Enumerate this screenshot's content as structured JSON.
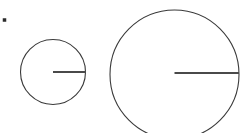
{
  "figure": {
    "background_color": "#ffffff",
    "width": 247,
    "height": 133,
    "stroke_color": "#3a3a3a",
    "radius_stroke_color": "#4a4a4a",
    "bullet_color": "#2b2b2b"
  },
  "chart_data": {
    "type": "diagram",
    "xlabel": "",
    "ylabel": "",
    "grid": false,
    "legend": null,
    "shapes": [
      {
        "name": "bullet-dot",
        "kind": "dot",
        "cx": 4.5,
        "cy": 20,
        "size": 3.5,
        "color": "#2b2b2b"
      },
      {
        "name": "small-circle",
        "kind": "circle",
        "cx": 53,
        "cy": 72,
        "r": 32.5,
        "stroke": "#3a3a3a",
        "stroke_width": 1.1,
        "fill": "none"
      },
      {
        "name": "small-circle-radius",
        "kind": "line",
        "x1": 53,
        "y1": 72,
        "x2": 86,
        "y2": 72,
        "stroke": "#4a4a4a",
        "stroke_width": 2.2
      },
      {
        "name": "large-circle",
        "kind": "circle",
        "cx": 174.5,
        "cy": 74.5,
        "r": 64.5,
        "stroke": "#3a3a3a",
        "stroke_width": 1.1,
        "fill": "none"
      },
      {
        "name": "large-circle-radius",
        "kind": "line",
        "x1": 174.5,
        "y1": 73,
        "x2": 239,
        "y2": 73,
        "stroke": "#4a4a4a",
        "stroke_width": 2.2
      }
    ],
    "labels": [],
    "annotations": []
  }
}
